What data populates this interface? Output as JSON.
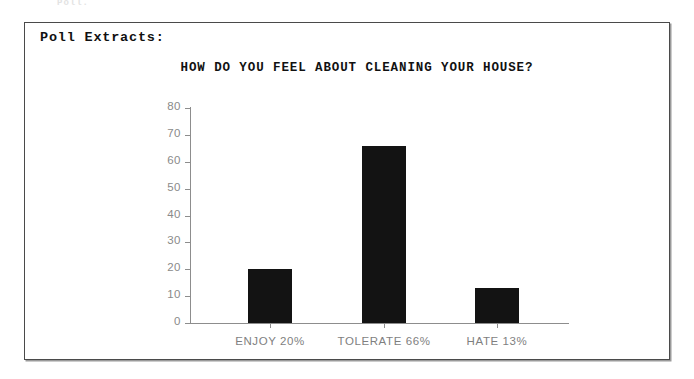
{
  "scan_artifact": "Poll.",
  "panel": {
    "heading": "Poll Extracts:"
  },
  "chart_data": {
    "type": "bar",
    "title": "HOW DO YOU FEEL ABOUT CLEANING YOUR HOUSE?",
    "xlabel": "",
    "ylabel": "",
    "categories": [
      "ENJOY  20%",
      "TOLERATE  66%",
      "HATE  13%"
    ],
    "category_names": [
      "ENJOY",
      "TOLERATE",
      "HATE"
    ],
    "percent_labels": [
      "20%",
      "66%",
      "13%"
    ],
    "values": [
      20,
      66,
      13
    ],
    "ylim": [
      0,
      80
    ],
    "yticks": [
      80,
      70,
      60,
      50,
      40,
      30,
      20,
      10,
      0
    ],
    "ytick_labels": [
      "80",
      "70",
      "60",
      "50",
      "40",
      "30",
      "20",
      "10",
      "0"
    ],
    "grid": false,
    "legend": null,
    "bar_color": "#131313",
    "axis_color": "#8d8d8d",
    "tick_label_color": "#8a8a8a"
  },
  "colors": {
    "background": "#ffffff",
    "frame": "#4a4a4a",
    "text": "#111111"
  }
}
